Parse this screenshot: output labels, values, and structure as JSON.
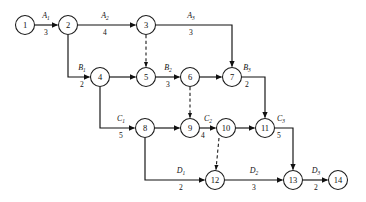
{
  "diagram": {
    "type": "activity-network",
    "stroke_color": "#111111",
    "background_color": "#ffffff",
    "node_radius": 9.5,
    "nodes": [
      {
        "id": "1",
        "label": "1",
        "x": 25,
        "y": 25
      },
      {
        "id": "2",
        "label": "2",
        "x": 68,
        "y": 25
      },
      {
        "id": "3",
        "label": "3",
        "x": 146,
        "y": 25
      },
      {
        "id": "4",
        "label": "4",
        "x": 100,
        "y": 77
      },
      {
        "id": "5",
        "label": "5",
        "x": 146,
        "y": 77
      },
      {
        "id": "6",
        "label": "6",
        "x": 190,
        "y": 77
      },
      {
        "id": "7",
        "label": "7",
        "x": 232,
        "y": 77
      },
      {
        "id": "8",
        "label": "8",
        "x": 145,
        "y": 128
      },
      {
        "id": "9",
        "label": "9",
        "x": 190,
        "y": 128
      },
      {
        "id": "10",
        "label": "10",
        "x": 226,
        "y": 128
      },
      {
        "id": "11",
        "label": "11",
        "x": 265,
        "y": 128
      },
      {
        "id": "12",
        "label": "12",
        "x": 215,
        "y": 180
      },
      {
        "id": "13",
        "label": "13",
        "x": 293,
        "y": 180
      },
      {
        "id": "14",
        "label": "14",
        "x": 338,
        "y": 180
      }
    ],
    "edges": [
      {
        "id": "e-1-2",
        "from": "1",
        "to": "2",
        "name": "A",
        "sub": "1",
        "weight": "3",
        "dashed": false
      },
      {
        "id": "e-2-3",
        "from": "2",
        "to": "3",
        "name": "A",
        "sub": "2",
        "weight": "4",
        "dashed": false
      },
      {
        "id": "e-3-7",
        "from": "3",
        "to": "7",
        "name": "A",
        "sub": "3",
        "weight": "3",
        "dashed": false
      },
      {
        "id": "e-2-4",
        "from": "2",
        "to": "4",
        "name": "B",
        "sub": "1",
        "weight": "2",
        "dashed": false
      },
      {
        "id": "e-4-5",
        "from": "4",
        "to": "5",
        "name": "",
        "sub": "",
        "weight": "",
        "dashed": false
      },
      {
        "id": "e-5-6",
        "from": "5",
        "to": "6",
        "name": "B",
        "sub": "2",
        "weight": "3",
        "dashed": false
      },
      {
        "id": "e-6-7",
        "from": "6",
        "to": "7",
        "name": "",
        "sub": "",
        "weight": "",
        "dashed": false
      },
      {
        "id": "e-7-11",
        "from": "7",
        "to": "11",
        "name": "B",
        "sub": "3",
        "weight": "2",
        "dashed": false
      },
      {
        "id": "e-4-8",
        "from": "4",
        "to": "8",
        "name": "C",
        "sub": "1",
        "weight": "5",
        "dashed": false
      },
      {
        "id": "e-8-9",
        "from": "8",
        "to": "9",
        "name": "",
        "sub": "",
        "weight": "",
        "dashed": false
      },
      {
        "id": "e-9-10",
        "from": "9",
        "to": "10",
        "name": "C",
        "sub": "2",
        "weight": "4",
        "dashed": false
      },
      {
        "id": "e-10-11",
        "from": "10",
        "to": "11",
        "name": "",
        "sub": "",
        "weight": "",
        "dashed": false
      },
      {
        "id": "e-11-13",
        "from": "11",
        "to": "13",
        "name": "C",
        "sub": "3",
        "weight": "5",
        "dashed": false
      },
      {
        "id": "e-8-12",
        "from": "8",
        "to": "12",
        "name": "D",
        "sub": "1",
        "weight": "2",
        "dashed": false
      },
      {
        "id": "e-12-13",
        "from": "12",
        "to": "13",
        "name": "D",
        "sub": "2",
        "weight": "3",
        "dashed": false
      },
      {
        "id": "e-13-14",
        "from": "13",
        "to": "14",
        "name": "D",
        "sub": "3",
        "weight": "2",
        "dashed": false
      },
      {
        "id": "e-3-5",
        "from": "3",
        "to": "5",
        "name": "",
        "sub": "",
        "weight": "",
        "dashed": true
      },
      {
        "id": "e-6-9",
        "from": "6",
        "to": "9",
        "name": "",
        "sub": "",
        "weight": "",
        "dashed": true
      },
      {
        "id": "e-10-12",
        "from": "10",
        "to": "12",
        "name": "",
        "sub": "",
        "weight": "",
        "dashed": true
      }
    ],
    "labels": {
      "A1": {
        "name": "A",
        "sub": "1",
        "weight": "3",
        "name_x": 46,
        "name_y": 18,
        "weight_x": 46,
        "weight_y": 35
      },
      "A2": {
        "name": "A",
        "sub": "2",
        "weight": "4",
        "name_x": 105,
        "name_y": 18,
        "weight_x": 105,
        "weight_y": 35
      },
      "A3": {
        "name": "A",
        "sub": "3",
        "weight": "3",
        "name_x": 191,
        "name_y": 18,
        "weight_x": 191,
        "weight_y": 35
      },
      "B1": {
        "name": "B",
        "sub": "1",
        "weight": "2",
        "name_x": 82,
        "name_y": 70,
        "weight_x": 82,
        "weight_y": 87
      },
      "B2": {
        "name": "B",
        "sub": "2",
        "weight": "3",
        "name_x": 168,
        "name_y": 70,
        "weight_x": 168,
        "weight_y": 87
      },
      "B3": {
        "name": "B",
        "sub": "3",
        "weight": "2",
        "name_x": 247,
        "name_y": 70,
        "weight_x": 247,
        "weight_y": 87
      },
      "C1": {
        "name": "C",
        "sub": "1",
        "weight": "5",
        "name_x": 121,
        "name_y": 121,
        "weight_x": 121,
        "weight_y": 138
      },
      "C2": {
        "name": "C",
        "sub": "2",
        "weight": "4",
        "name_x": 208,
        "name_y": 121,
        "weight_x": 208,
        "weight_y": 138
      },
      "C3": {
        "name": "C",
        "sub": "3",
        "weight": "5",
        "name_x": 281,
        "name_y": 121,
        "weight_x": 281,
        "weight_y": 138
      },
      "D1": {
        "name": "D",
        "sub": "1",
        "weight": "2",
        "name_x": 181,
        "name_y": 173,
        "weight_x": 181,
        "weight_y": 190
      },
      "D2": {
        "name": "D",
        "sub": "2",
        "weight": "3",
        "name_x": 254,
        "name_y": 173,
        "weight_x": 254,
        "weight_y": 190
      },
      "D3": {
        "name": "D",
        "sub": "3",
        "weight": "2",
        "name_x": 316,
        "name_y": 173,
        "weight_x": 316,
        "weight_y": 190
      }
    }
  }
}
